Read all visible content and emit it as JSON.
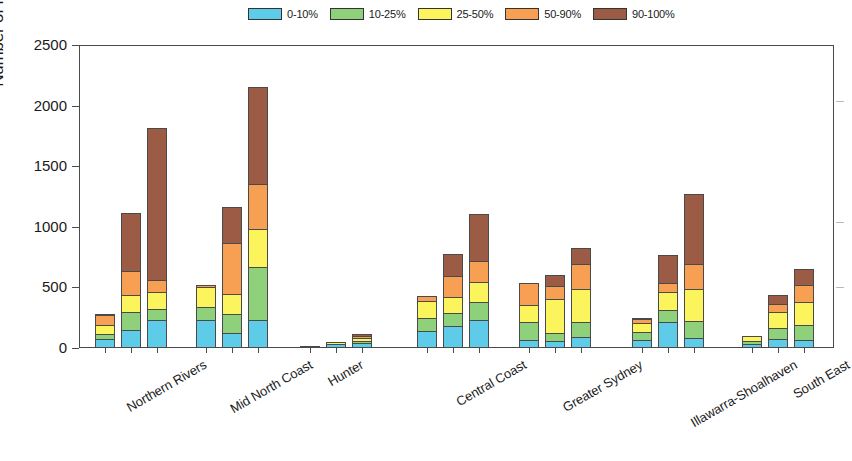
{
  "chart_data": {
    "type": "bar",
    "stacked": true,
    "title": "",
    "xlabel": "",
    "ylabel": "Number of Properties",
    "ylim": [
      0,
      2500
    ],
    "yticks": [
      0,
      500,
      1000,
      1500,
      2000,
      2500
    ],
    "grid": false,
    "legend_position": "top-center",
    "categories": [
      "Northern Rivers",
      "Mid North Coast",
      "Hunter",
      "Central Coast",
      "Greater Sydney",
      "Illawarra-Shoalhaven",
      "South East"
    ],
    "bars_per_category": 3,
    "series": [
      {
        "name": "0-10%",
        "color": "#5ecbe8",
        "values": [
          [
            75,
            150,
            230
          ],
          [
            230,
            125,
            230
          ],
          [
            8,
            30,
            45
          ],
          [
            140,
            180,
            235
          ],
          [
            70,
            55,
            90
          ],
          [
            70,
            215,
            80
          ],
          [
            35,
            75,
            65
          ]
        ]
      },
      {
        "name": "10-25%",
        "color": "#8ed17a",
        "values": [
          [
            125,
            305,
            330
          ],
          [
            345,
            290,
            675
          ],
          [
            12,
            45,
            70
          ],
          [
            255,
            300,
            385
          ],
          [
            225,
            130,
            225
          ],
          [
            140,
            325,
            230
          ],
          [
            65,
            170,
            195
          ]
        ]
      },
      {
        "name": "25-50%",
        "color": "#fbf45c",
        "values": [
          [
            210,
            455,
            475
          ],
          [
            520,
            460,
            1000
          ],
          [
            17,
            65,
            100
          ],
          [
            405,
            440,
            560
          ],
          [
            375,
            420,
            500
          ],
          [
            225,
            480,
            500
          ],
          [
            115,
            310,
            395
          ]
        ]
      },
      {
        "name": "50-90%",
        "color": "#f7a054",
        "values": [
          [
            300,
            660,
            590
          ],
          [
            545,
            890,
            1380
          ],
          [
            19,
            75,
            120
          ],
          [
            450,
            620,
            740
          ],
          [
            565,
            540,
            720
          ],
          [
            265,
            565,
            720
          ],
          [
            120,
            390,
            545
          ]
        ]
      },
      {
        "name": "90-100%",
        "color": "#9c5b44",
        "values": [
          [
            310,
            1150,
            1850
          ],
          [
            545,
            1195,
            2185
          ],
          [
            20,
            85,
            145
          ],
          [
            455,
            810,
            1135
          ],
          [
            570,
            635,
            858
          ],
          [
            285,
            800,
            1300
          ],
          [
            120,
            470,
            685
          ]
        ]
      }
    ]
  },
  "legend": {
    "items": [
      {
        "label": "0-10%",
        "color": "#5ecbe8"
      },
      {
        "label": "10-25%",
        "color": "#8ed17a"
      },
      {
        "label": "25-50%",
        "color": "#fbf45c"
      },
      {
        "label": "50-90%",
        "color": "#f7a054"
      },
      {
        "label": "90-100%",
        "color": "#9c5b44"
      }
    ]
  },
  "axes": {
    "y_title": "Number of Properties",
    "y_tick_labels": [
      "2500",
      "2000",
      "1500",
      "1000",
      "500",
      "0"
    ]
  }
}
